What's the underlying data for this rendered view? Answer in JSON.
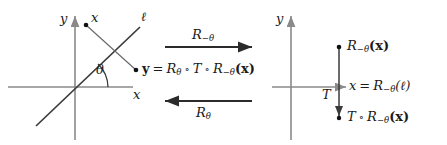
{
  "figure": {
    "colors": {
      "stroke": "#3a3a3a",
      "axis": "#8a8a8a",
      "text": "#1a1a1a",
      "background": "#ffffff"
    }
  },
  "left_panel": {
    "axis_y_label": "y",
    "axis_x_label": "x",
    "line_label": "ℓ",
    "point_x_label": "x",
    "angle_label": "θ",
    "result_label": {
      "point": "y",
      "equals": "=",
      "rot_pos": "R",
      "rot_pos_sub": "θ",
      "compose1": "∘",
      "translate": "T",
      "compose2": "∘",
      "rot_neg": "R",
      "rot_neg_sub": "−θ",
      "argument": "(x)"
    }
  },
  "middle_arrows": {
    "top": {
      "label_base": "R",
      "label_sub": "−θ",
      "direction": "right"
    },
    "bottom": {
      "label_base": "R",
      "label_sub": "θ",
      "direction": "left"
    }
  },
  "right_panel": {
    "axis_y_label": "y",
    "translate_label": "T",
    "top_point_label": {
      "base": "R",
      "sub": "−θ",
      "argument": "(x)"
    },
    "axis_x_label": {
      "axis": "x",
      "equals": "=",
      "base": "R",
      "sub": "−θ",
      "argument": "(ℓ)"
    },
    "bottom_point_label": {
      "translate": "T",
      "compose": "∘",
      "base": "R",
      "sub": "−θ",
      "argument": "(x)"
    }
  }
}
